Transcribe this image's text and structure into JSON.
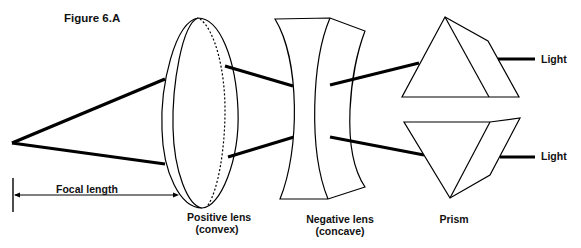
{
  "figure": {
    "title": "Figure 6.A"
  },
  "labels": {
    "focal_length": "Focal length",
    "positive_lens_line1": "Positive lens",
    "positive_lens_line2": "(convex)",
    "negative_lens_line1": "Negative lens",
    "negative_lens_line2": "(concave)",
    "prism": "Prism",
    "light_top": "Light",
    "light_bottom": "Light"
  },
  "colors": {
    "stroke": "#000000",
    "background": "#ffffff"
  }
}
